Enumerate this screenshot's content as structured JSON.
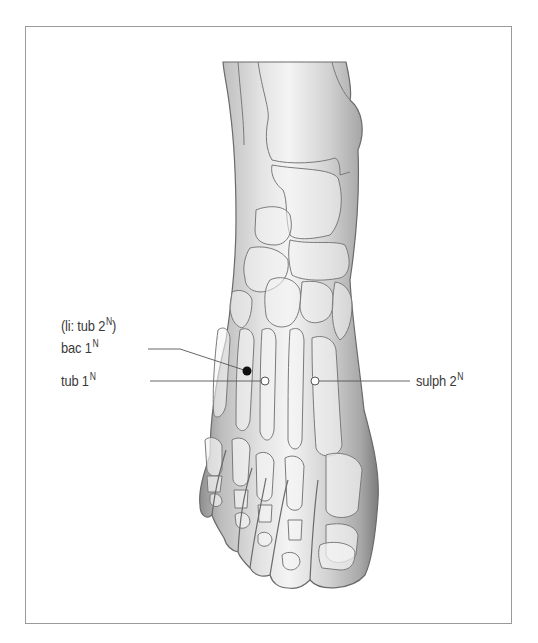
{
  "figure": {
    "frame_color": "#9a9a9a",
    "line_color": "#555555"
  },
  "labels": {
    "li_tub2": {
      "prefix": "(li: tub 2",
      "sup": "N",
      "suffix": ")"
    },
    "bac1": {
      "text": "bac 1",
      "sup": "N"
    },
    "tub1": {
      "text": "tub 1",
      "sup": "N"
    },
    "sulph2": {
      "text": "sulph 2",
      "sup": "N"
    }
  },
  "points": [
    {
      "name": "bac 1",
      "style": "filled",
      "x": 247,
      "y": 371
    },
    {
      "name": "tub 1",
      "style": "open",
      "x": 265,
      "y": 381
    },
    {
      "name": "sulph 2",
      "style": "open",
      "x": 315,
      "y": 381
    }
  ]
}
